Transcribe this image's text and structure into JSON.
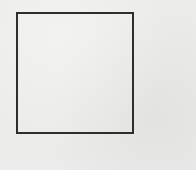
{
  "diagram": {
    "shapes": [
      {
        "type": "square",
        "stroke_color": "#2e2e2e",
        "fill": "none"
      }
    ],
    "background_color": "#ebebe9"
  }
}
